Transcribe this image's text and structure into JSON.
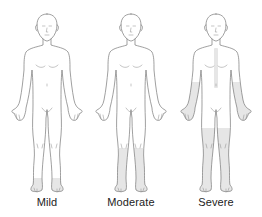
{
  "figures": [
    {
      "label": "Mild",
      "shaded_regions": [
        "feet"
      ],
      "shade_color": "#e6e6e6"
    },
    {
      "label": "Moderate",
      "shaded_regions": [
        "feet",
        "lower-legs"
      ],
      "shade_color": "#e6e6e6"
    },
    {
      "label": "Severe",
      "shaded_regions": [
        "feet",
        "lower-legs",
        "thighs",
        "forearms",
        "hands",
        "central-torso"
      ],
      "shade_color": "#e6e6e6"
    }
  ]
}
